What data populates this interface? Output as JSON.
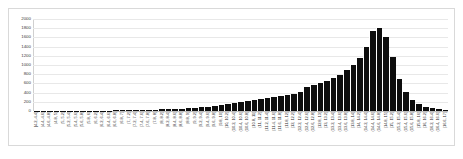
{
  "chart_data": {
    "type": "bar",
    "title": "",
    "subtitle": "",
    "xlabel": "",
    "ylabel": "",
    "ylim": [
      0,
      2000
    ],
    "yticks": [
      0,
      200,
      400,
      600,
      800,
      1000,
      1200,
      1400,
      1600,
      1800,
      2000
    ],
    "grid": true,
    "legend": null,
    "legend_position": "none",
    "bar_color": "#0d0d0d",
    "gridline_color": "#e8e8e8",
    "categories": [
      "[4.2, 4.4]",
      "(4.4, 4.6]",
      "(4.6, 4.8]",
      "(4.8, 5]",
      "(5, 5.2]",
      "(5.2, 5.4]",
      "(5.4, 5.6]",
      "(5.6, 5.8]",
      "(5.8, 6]",
      "(6, 6.2]",
      "(6.2, 6.4]",
      "(6.4, 6.6]",
      "(6.6, 6.8]",
      "(6.8, 7]",
      "(7, 7.2]",
      "(7.2, 7.4]",
      "(7.4, 7.6]",
      "(7.6, 7.8]",
      "(7.8, 8]",
      "(8, 8.2]",
      "(8.2, 8.4]",
      "(8.4, 8.6]",
      "(8.6, 8.8]",
      "(8.8, 9]",
      "(9, 9.2]",
      "(9.2, 9.4]",
      "(9.4, 9.6]",
      "(9.6, 9.8]",
      "(9.8, 10]",
      "(10, 10.2]",
      "(10.2, 10.4]",
      "(10.4, 10.6]",
      "(10.6, 10.8]",
      "(10.8, 11]",
      "(11, 11.2]",
      "(11.2, 11.4]",
      "(11.4, 11.6]",
      "(11.6, 11.8]",
      "(11.8, 12]",
      "(12, 12.2]",
      "(12.2, 12.4]",
      "(12.4, 12.6]",
      "(12.6, 12.8]",
      "(12.8, 13]",
      "(13, 13.2]",
      "(13.2, 13.4]",
      "(13.4, 13.6]",
      "(13.6, 13.8]",
      "(13.8, 14]",
      "(14, 14.2]",
      "(14.2, 14.4]",
      "(14.4, 14.6]",
      "(14.6, 14.8]",
      "(14.8, 15]",
      "(15, 15.2]",
      "(15.2, 15.4]",
      "(15.4, 15.6]",
      "(15.6, 15.8]",
      "(15.8, 16]",
      "(16, 16.2]",
      "(16.2, 16.4]",
      "(16.4, 16.6]",
      "(16.6, 17]"
    ],
    "values": [
      2,
      2,
      3,
      3,
      4,
      5,
      5,
      6,
      7,
      8,
      9,
      10,
      12,
      14,
      16,
      18,
      21,
      24,
      28,
      33,
      38,
      45,
      52,
      60,
      70,
      82,
      95,
      110,
      128,
      150,
      175,
      200,
      225,
      250,
      265,
      275,
      300,
      320,
      345,
      375,
      420,
      520,
      560,
      600,
      660,
      720,
      790,
      900,
      1000,
      1150,
      1400,
      1750,
      1800,
      1600,
      1180,
      700,
      420,
      250,
      150,
      95,
      60,
      40,
      30
    ]
  }
}
